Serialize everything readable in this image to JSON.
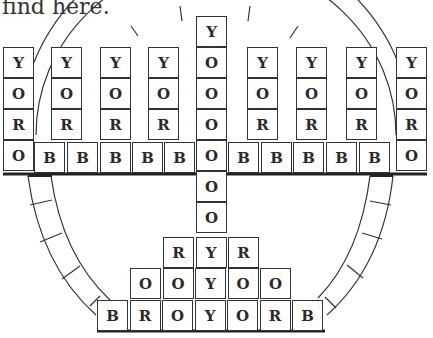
{
  "caption": "find here.",
  "cell_size": 31,
  "columns": [
    {
      "x": 3,
      "top": 47,
      "letters": [
        "Y",
        "O",
        "R",
        "O"
      ]
    },
    {
      "x": 51,
      "top": 47,
      "letters": [
        "Y",
        "O",
        "R"
      ]
    },
    {
      "x": 100,
      "top": 47,
      "letters": [
        "Y",
        "O",
        "R"
      ]
    },
    {
      "x": 148,
      "top": 47,
      "letters": [
        "Y",
        "O",
        "R"
      ]
    },
    {
      "x": 196,
      "top": 16,
      "letters": [
        "Y",
        "O",
        "O",
        "O",
        "O",
        "O",
        "O"
      ]
    },
    {
      "x": 247,
      "top": 47,
      "letters": [
        "Y",
        "O",
        "R"
      ]
    },
    {
      "x": 296,
      "top": 47,
      "letters": [
        "Y",
        "O",
        "R"
      ]
    },
    {
      "x": 346,
      "top": 47,
      "letters": [
        "Y",
        "O",
        "R"
      ]
    },
    {
      "x": 396,
      "top": 47,
      "letters": [
        "Y",
        "O",
        "R",
        "O"
      ]
    }
  ],
  "bar_row": {
    "y": 142,
    "cells": [
      {
        "x": 34,
        "letter": "B"
      },
      {
        "x": 67,
        "letter": "B"
      },
      {
        "x": 100,
        "letter": "B"
      },
      {
        "x": 132,
        "letter": "B"
      },
      {
        "x": 164,
        "letter": "B"
      },
      {
        "x": 228,
        "letter": "B"
      },
      {
        "x": 261,
        "letter": "B"
      },
      {
        "x": 293,
        "letter": "B"
      },
      {
        "x": 326,
        "letter": "B"
      },
      {
        "x": 359,
        "letter": "B"
      }
    ]
  },
  "pyramid": [
    {
      "y": 237,
      "x": 163,
      "letters": [
        "R",
        "Y",
        "R"
      ]
    },
    {
      "y": 268,
      "x": 130,
      "letters": [
        "O",
        "O",
        "Y",
        "O",
        "O"
      ]
    },
    {
      "y": 300,
      "x": 97,
      "letters": [
        "B",
        "R",
        "O",
        "Y",
        "O",
        "R",
        "B"
      ]
    }
  ]
}
